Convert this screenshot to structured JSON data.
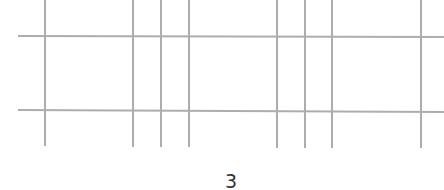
{
  "diagram": {
    "line_color": "#adadad",
    "horizontal_lines": [
      {
        "y1": 36,
        "y2": 37,
        "x_start": 18,
        "x_end": 444
      },
      {
        "y1": 110,
        "y2": 112,
        "x_start": 18,
        "x_end": 444
      }
    ],
    "vertical_lines": [
      {
        "x": 45,
        "y_start": 0,
        "y_end": 146
      },
      {
        "x": 133,
        "y_start": 0,
        "y_end": 147
      },
      {
        "x": 161,
        "y_start": 0,
        "y_end": 147
      },
      {
        "x": 189,
        "y_start": 0,
        "y_end": 147
      },
      {
        "x": 277,
        "y_start": 0,
        "y_end": 148
      },
      {
        "x": 305,
        "y_start": 0,
        "y_end": 148
      },
      {
        "x": 332,
        "y_start": 0,
        "y_end": 148
      },
      {
        "x": 421,
        "y_start": 0,
        "y_end": 148
      }
    ]
  },
  "page": {
    "number": "3"
  }
}
